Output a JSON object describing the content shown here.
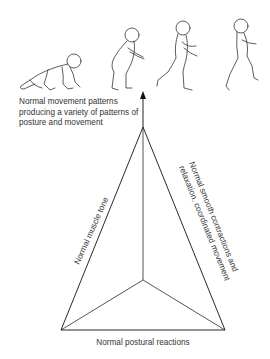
{
  "figure": {
    "top_caption": "Normal movement patterns producing a variety of patterns of posture and movement",
    "edges": {
      "left": "Normal muscle tone",
      "right_line1": "Normal smooth contractions and",
      "right_line2": "relaxation, coordinated movement",
      "bottom": "Normal postural reactions"
    },
    "illustrations": [
      {
        "name": "crawling-child"
      },
      {
        "name": "standing-child"
      },
      {
        "name": "walking-child"
      },
      {
        "name": "running-child"
      }
    ],
    "colors": {
      "line": "#2a2a2a",
      "background": "#ffffff"
    }
  }
}
